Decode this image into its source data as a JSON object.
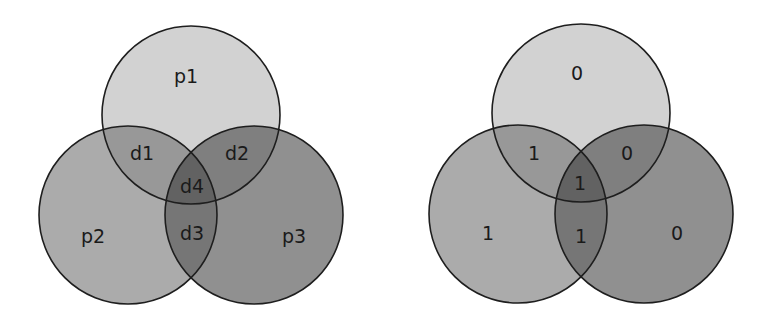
{
  "diagrams": [
    {
      "name": "venn-labels",
      "regions": {
        "p1": "p1",
        "p2": "p2",
        "p3": "p3",
        "d1": "d1",
        "d2": "d2",
        "d3": "d3",
        "d4": "d4"
      }
    },
    {
      "name": "venn-values",
      "regions": {
        "p1": "0",
        "p2": "1",
        "p3": "0",
        "d1": "1",
        "d2": "0",
        "d3": "1",
        "d4": "1"
      }
    }
  ],
  "colors": {
    "top": "#d2d2d2",
    "left": "#ababab",
    "right": "#909090",
    "top_left": "#989898",
    "top_right": "#7f7f7f",
    "left_right": "#767676",
    "all": "#626262",
    "stroke": "#1e1e1e"
  }
}
